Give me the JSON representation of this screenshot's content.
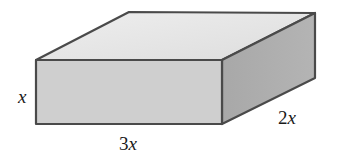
{
  "figure": {
    "type": "rectangular-prism",
    "labels": {
      "height": {
        "coef": "",
        "var": "x"
      },
      "length": {
        "coef": "3",
        "var": "x"
      },
      "depth": {
        "coef": "2",
        "var": "x"
      }
    },
    "colors": {
      "top": "#e6e6e6",
      "front": "#cfcfcf",
      "side": "#a9a9a9",
      "edge": "#4a4a4a"
    }
  }
}
